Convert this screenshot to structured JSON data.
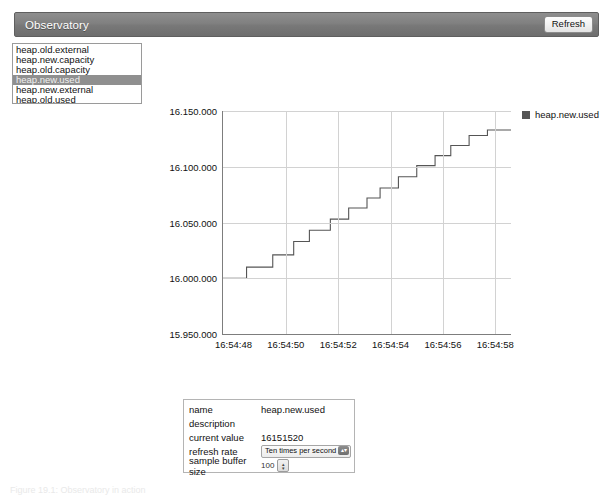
{
  "header": {
    "title": "Observatory",
    "refresh_label": "Refresh",
    "bar_color": "#7c7c7c"
  },
  "metric_list": {
    "items": [
      {
        "label": "heap.old.external",
        "selected": false
      },
      {
        "label": "heap.new.capacity",
        "selected": false
      },
      {
        "label": "heap.old.capacity",
        "selected": false
      },
      {
        "label": "heap.new.used",
        "selected": true
      },
      {
        "label": "heap.new.external",
        "selected": false
      },
      {
        "label": "heap.old.used",
        "selected": false
      }
    ]
  },
  "legend": {
    "label": "heap.new.used",
    "color": "#555555"
  },
  "chart_data": {
    "type": "line",
    "title": "",
    "xlabel": "",
    "ylabel": "",
    "step": true,
    "grid": true,
    "legend_position": "top-right",
    "line_color": "#555555",
    "ylim": [
      15950000,
      16150000
    ],
    "yticks": [
      15950000,
      16000000,
      16050000,
      16100000,
      16150000
    ],
    "ytick_labels": [
      "15.950.000",
      "16.000.000",
      "16.050.000",
      "16.100.000",
      "16.150.000"
    ],
    "xticks": [
      "16:54:48",
      "16:54:50",
      "16:54:52",
      "16:54:54",
      "16:54:56",
      "16:54:58"
    ],
    "xlim": [
      "16:54:47.6",
      "16:54:58.6"
    ],
    "series": [
      {
        "name": "heap.new.used",
        "x": [
          0.0,
          0.9,
          0.9,
          1.9,
          1.9,
          2.7,
          2.7,
          3.3,
          3.3,
          4.1,
          4.1,
          4.8,
          4.8,
          5.5,
          5.5,
          6.0,
          6.0,
          6.7,
          6.7,
          7.4,
          7.4,
          8.1,
          8.1,
          8.7,
          8.7,
          9.4,
          9.4,
          10.1,
          10.1,
          11.0
        ],
        "y": [
          16000000,
          16000000,
          16010000,
          16010000,
          16021000,
          16021000,
          16033000,
          16033000,
          16043000,
          16043000,
          16053000,
          16053000,
          16063000,
          16063000,
          16072000,
          16072000,
          16081000,
          16081000,
          16091000,
          16091000,
          16101000,
          16101000,
          16110000,
          16110000,
          16119000,
          16119000,
          16128000,
          16128000,
          16133000,
          16133000
        ]
      }
    ]
  },
  "detail": {
    "rows": [
      {
        "key": "name",
        "value": "heap.new.used",
        "type": "text"
      },
      {
        "key": "description",
        "value": "",
        "type": "text"
      },
      {
        "key": "current value",
        "value": "16151520",
        "type": "text"
      },
      {
        "key": "refresh rate",
        "value": "Ten times per second",
        "type": "select"
      },
      {
        "key": "sample buffer size",
        "value": "100",
        "type": "stepper"
      }
    ]
  },
  "caption": {
    "text": "Figure 19.1: Observatory in action"
  }
}
